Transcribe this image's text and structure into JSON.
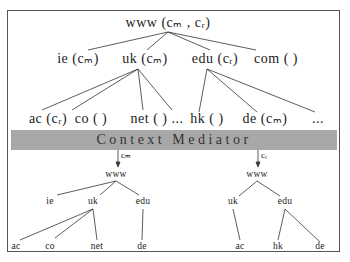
{
  "diagram": {
    "type": "tree-with-mediator",
    "top_tree": {
      "root": {
        "label": "www",
        "contexts": "(cₘ , cᵣ)"
      },
      "level1": [
        {
          "label": "ie",
          "contexts": "(cₘ)"
        },
        {
          "label": "uk",
          "contexts": "(cₘ)"
        },
        {
          "label": "edu",
          "contexts": "(cᵣ)"
        },
        {
          "label": "com",
          "contexts": "( )"
        }
      ],
      "level2": [
        {
          "label": "ac",
          "contexts": "(cᵣ)",
          "parent": "uk"
        },
        {
          "label": "co",
          "contexts": "( )",
          "parent": "uk"
        },
        {
          "label": "net",
          "contexts": "( ) ...",
          "parent": "uk"
        },
        {
          "label": "hk",
          "contexts": "( )",
          "parent": "edu"
        },
        {
          "label": "de",
          "contexts": "(cₘ)",
          "parent": "edu"
        },
        {
          "label": "...",
          "contexts": "",
          "parent": "edu"
        }
      ]
    },
    "mediator": {
      "label": "Context Mediator"
    },
    "left_view": {
      "context": "cₘ",
      "root": "www",
      "level1": [
        "ie",
        "uk",
        "edu"
      ],
      "level2": [
        "ac",
        "co",
        "net",
        "de"
      ]
    },
    "right_view": {
      "context": "cᵣ",
      "root": "www",
      "level1": [
        "uk",
        "edu"
      ],
      "level2": [
        "ac",
        "hk",
        "de"
      ]
    }
  }
}
